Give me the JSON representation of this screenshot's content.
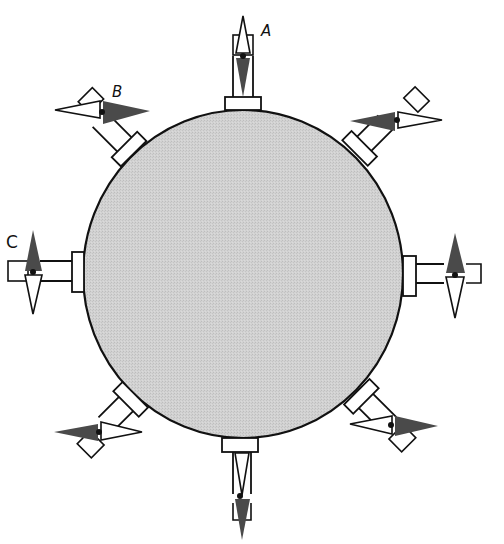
{
  "diagram": {
    "colors": {
      "disc_fill": "#cfcfcf",
      "stroke": "#111111",
      "needle_dark": "#4a4a4a",
      "needle_light": "#ffffff",
      "background": "#ffffff"
    },
    "disc": {
      "cx": 243,
      "cy": 274,
      "rx": 160,
      "ry": 164
    },
    "labels": [
      {
        "id": "A",
        "text": "A",
        "x": 261,
        "y": 34
      },
      {
        "id": "B",
        "text": "B",
        "x": 113,
        "y": 96
      },
      {
        "id": "C",
        "text": "C",
        "x": 7,
        "y": 247
      }
    ],
    "compasses": [
      {
        "position": "top",
        "angle_deg": 0,
        "label": "A",
        "dark_end": "toward-disc"
      },
      {
        "position": "top-left",
        "angle_deg": -45,
        "label": "B",
        "dark_end": "east"
      },
      {
        "position": "left",
        "angle_deg": -90,
        "label": "C",
        "dark_end": "north"
      },
      {
        "position": "bottom-left",
        "angle_deg": -135,
        "label": "",
        "dark_end": "west"
      },
      {
        "position": "bottom",
        "angle_deg": 180,
        "label": "",
        "dark_end": "south"
      },
      {
        "position": "bottom-right",
        "angle_deg": 135,
        "label": "",
        "dark_end": "east"
      },
      {
        "position": "right",
        "angle_deg": 90,
        "label": "",
        "dark_end": "north"
      },
      {
        "position": "top-right",
        "angle_deg": 45,
        "label": "",
        "dark_end": "west"
      }
    ]
  }
}
